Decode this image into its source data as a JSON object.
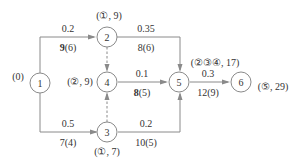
{
  "diagram": {
    "nodes": [
      {
        "id": "1",
        "label": "1",
        "annotation": "(0)"
      },
      {
        "id": "2",
        "label": "2",
        "annotation": "(①, 9)"
      },
      {
        "id": "3",
        "label": "3",
        "annotation": "(①, 7)"
      },
      {
        "id": "4",
        "label": "4",
        "annotation": "(②, 9)"
      },
      {
        "id": "5",
        "label": "5",
        "annotation": "(②③④, 17)"
      },
      {
        "id": "6",
        "label": "6",
        "annotation": "(⑤, 29)"
      }
    ],
    "edges": [
      {
        "from": "1",
        "to": "2",
        "top": "0.2",
        "bottom_bold": "9",
        "bottom_rest": "(6)",
        "style": "solid"
      },
      {
        "from": "1",
        "to": "3",
        "top": "0.5",
        "bottom_bold": "",
        "bottom_rest": "7(4)",
        "style": "solid"
      },
      {
        "from": "2",
        "to": "5",
        "top": "0.35",
        "bottom_bold": "",
        "bottom_rest": "8(6)",
        "style": "solid"
      },
      {
        "from": "4",
        "to": "5",
        "top": "0.1",
        "bottom_bold": "8",
        "bottom_rest": "(5)",
        "style": "solid"
      },
      {
        "from": "3",
        "to": "5",
        "top": "0.2",
        "bottom_bold": "",
        "bottom_rest": "10(5)",
        "style": "solid"
      },
      {
        "from": "5",
        "to": "6",
        "top": "0.3",
        "bottom_bold": "",
        "bottom_rest": "12(9)",
        "style": "solid"
      },
      {
        "from": "2",
        "to": "4",
        "top": "",
        "bottom_bold": "",
        "bottom_rest": "",
        "style": "dashed"
      },
      {
        "from": "3",
        "to": "4",
        "top": "",
        "bottom_bold": "",
        "bottom_rest": "",
        "style": "dashed"
      }
    ]
  }
}
